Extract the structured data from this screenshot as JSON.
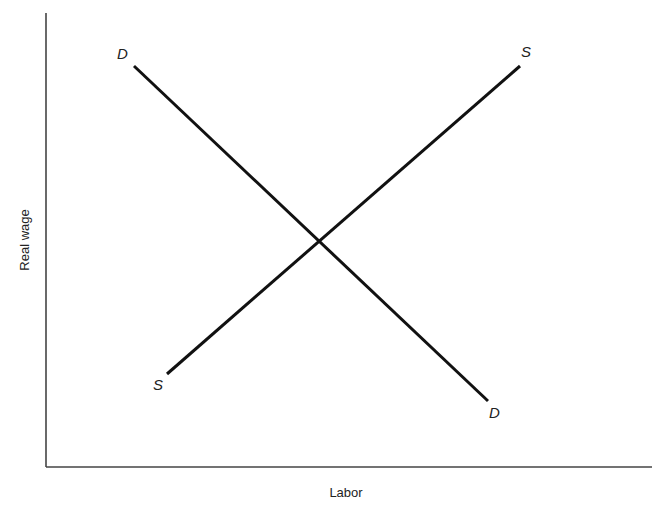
{
  "diagram": {
    "type": "supply-demand",
    "axes": {
      "x_label": "Labor",
      "y_label": "Real wage"
    },
    "curves": {
      "demand": {
        "label_top": "D",
        "label_bottom": "D",
        "color": "#111111"
      },
      "supply": {
        "label_top": "S",
        "label_bottom": "S",
        "color": "#111111"
      }
    },
    "equilibrium": {
      "visible": false
    }
  }
}
